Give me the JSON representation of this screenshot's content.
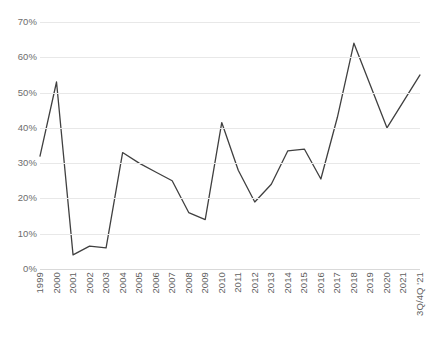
{
  "chart_data": {
    "type": "line",
    "title": "",
    "subtitle": "",
    "xlabel": "",
    "ylabel": "",
    "grid": true,
    "legend": false,
    "line_color": "#404040",
    "gridline_color": "#e8e8e8",
    "axis_label_color": "#5f5f5f",
    "ylim": [
      0,
      70
    ],
    "ytick_labels": [
      "70%",
      "60%",
      "50%",
      "40%",
      "30%",
      "20%",
      "10%",
      "0%"
    ],
    "ytick_values": [
      70,
      60,
      50,
      40,
      30,
      20,
      10,
      0
    ],
    "categories": [
      "1999",
      "2000",
      "2001",
      "2002",
      "2003",
      "2004",
      "2005",
      "2006",
      "2007",
      "2008",
      "2009",
      "2010",
      "2011",
      "2012",
      "2013",
      "2014",
      "2015",
      "2016",
      "2017",
      "2018",
      "2019",
      "2020",
      "2021",
      "3Q/4Q '21"
    ],
    "values": [
      32,
      53,
      4,
      6.5,
      6,
      33,
      30,
      27.5,
      25,
      16,
      14,
      41.5,
      28,
      19,
      24,
      33.5,
      34,
      25.5,
      43,
      64,
      52,
      40,
      47.5,
      55
    ]
  }
}
